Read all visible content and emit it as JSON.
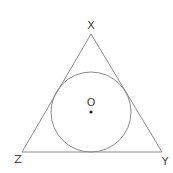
{
  "diagram": {
    "type": "triangle-with-inscribed-circle",
    "stroke_color": "#8a8a8a",
    "label_color": "#444444",
    "vertices": {
      "X": {
        "label": "X",
        "x": 91,
        "y": 34
      },
      "Y": {
        "label": "Y",
        "x": 162,
        "y": 152
      },
      "Z": {
        "label": "Z",
        "x": 22,
        "y": 152
      }
    },
    "incircle": {
      "center_label": "O",
      "cx": 91,
      "cy": 112,
      "r": 40
    }
  }
}
